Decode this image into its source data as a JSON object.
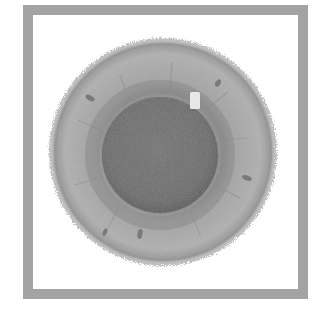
{
  "illustration": {
    "subject": "eye-iris",
    "style": "grayscale",
    "colors": {
      "background": "#ffffff",
      "frame": "#a3a3a3",
      "iris_outer": "#b0b0b0",
      "iris_inner": "#9a9a9a",
      "limbal_ring": "#8c8c8c",
      "collarette": "#7e7e7e",
      "pupil": "#6f6f6f",
      "pupil_edge": "#5e5e5e",
      "catchlight": "#e6e6e6",
      "spots": "#7a7a7a"
    },
    "iris": {
      "cx": 163,
      "cy": 152,
      "r": 114
    },
    "pupil": {
      "cx": 160,
      "cy": 155,
      "r": 58
    },
    "catchlight": {
      "x": 190,
      "y": 92,
      "width": 10,
      "height": 17
    },
    "spots": [
      {
        "x": 90,
        "y": 98,
        "rx": 5,
        "ry": 2.5,
        "rot": 30
      },
      {
        "x": 218,
        "y": 83,
        "rx": 2.5,
        "ry": 4,
        "rot": 30
      },
      {
        "x": 247,
        "y": 178,
        "rx": 5,
        "ry": 2.5,
        "rot": 20
      },
      {
        "x": 105,
        "y": 232,
        "rx": 2,
        "ry": 4,
        "rot": 20
      },
      {
        "x": 140,
        "y": 234,
        "rx": 2.5,
        "ry": 5,
        "rot": 10
      }
    ]
  }
}
